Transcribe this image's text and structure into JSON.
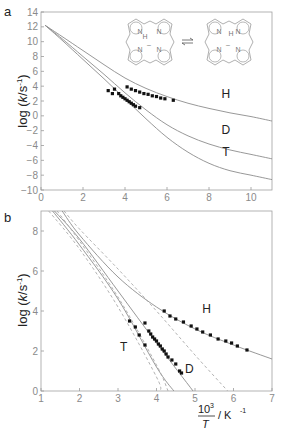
{
  "chart_data": [
    {
      "panel": "a",
      "type": "line",
      "panel_label": "a",
      "xlabel": "",
      "ylabel": "log (k/s-1)",
      "xlim": [
        0,
        11
      ],
      "ylim": [
        -10,
        14
      ],
      "xticks": [
        0,
        2,
        4,
        6,
        8,
        10
      ],
      "yticks": [
        14,
        12,
        10,
        8,
        6,
        4,
        2,
        0,
        -2,
        -4,
        -6,
        -8,
        -10
      ],
      "grid": false,
      "annotation": "porphyrin NH tautomerism (structure inset, equilibrium arrows)",
      "series": [
        {
          "name": "H",
          "style": "solid",
          "x": [
            0.2,
            1,
            2,
            3,
            4,
            5,
            6,
            7,
            8,
            9,
            10,
            11
          ],
          "y": [
            12.2,
            10.7,
            8.8,
            6.9,
            5.1,
            3.7,
            2.6,
            1.7,
            1.0,
            0.4,
            -0.1,
            -0.7
          ]
        },
        {
          "name": "D",
          "style": "solid",
          "x": [
            0.2,
            1,
            2,
            3,
            4,
            5,
            6,
            7,
            8,
            9,
            10,
            11
          ],
          "y": [
            12.2,
            10.4,
            8.0,
            5.6,
            3.1,
            0.8,
            -1.2,
            -2.7,
            -3.8,
            -4.6,
            -5.2,
            -5.8
          ]
        },
        {
          "name": "T",
          "style": "solid",
          "x": [
            0.2,
            1,
            2,
            3,
            4,
            5,
            6,
            7,
            8,
            9,
            10,
            11
          ],
          "y": [
            12.2,
            10.2,
            7.6,
            5.0,
            2.3,
            -0.4,
            -2.9,
            -4.9,
            -6.4,
            -7.4,
            -8.0,
            -8.6
          ]
        },
        {
          "name": "H data",
          "style": "points",
          "x": [
            4.1,
            4.3,
            4.5,
            4.7,
            4.9,
            5.1,
            5.3,
            5.5,
            5.7,
            5.9,
            6.3
          ],
          "y": [
            3.9,
            3.6,
            3.4,
            3.2,
            3.0,
            2.9,
            2.7,
            2.6,
            2.4,
            2.3,
            2.1
          ]
        },
        {
          "name": "D/T data",
          "style": "points",
          "x": [
            3.2,
            3.4,
            3.5,
            3.7,
            3.8,
            3.9,
            4.0,
            4.1,
            4.2,
            4.3,
            4.4,
            4.5,
            4.7
          ],
          "y": [
            3.4,
            3.0,
            3.6,
            3.0,
            2.7,
            2.5,
            2.3,
            2.1,
            1.9,
            1.7,
            1.5,
            1.3,
            1.1
          ]
        }
      ],
      "curve_labels": [
        {
          "text": "H",
          "x": 8.8,
          "y": 2.4
        },
        {
          "text": "D",
          "x": 8.8,
          "y": -2.4
        },
        {
          "text": "T",
          "x": 8.8,
          "y": -5.4
        }
      ]
    },
    {
      "panel": "b",
      "type": "line",
      "panel_label": "b",
      "xlabel": "10^3/T / K-1",
      "ylabel": "log (k/s-1)",
      "xlim": [
        1,
        7
      ],
      "ylim": [
        0,
        9
      ],
      "xticks": [
        1,
        2,
        3,
        4,
        5,
        6,
        7
      ],
      "yticks": [
        8,
        6,
        4,
        2,
        0
      ],
      "grid": false,
      "series": [
        {
          "name": "H",
          "style": "solid",
          "x": [
            1.55,
            2,
            3,
            4,
            5,
            6,
            7
          ],
          "y": [
            9.0,
            7.8,
            5.7,
            4.2,
            3.1,
            2.3,
            1.6
          ]
        },
        {
          "name": "D",
          "style": "solid",
          "x": [
            1.35,
            2,
            3,
            4,
            4.95
          ],
          "y": [
            9.0,
            7.6,
            5.0,
            2.4,
            0.0
          ]
        },
        {
          "name": "T",
          "style": "solid",
          "x": [
            1.3,
            2,
            3,
            4,
            4.45
          ],
          "y": [
            9.0,
            7.3,
            4.6,
            1.2,
            0.0
          ]
        },
        {
          "name": "D (dashed)",
          "style": "dashed",
          "x": [
            1.6,
            2,
            3,
            4,
            5,
            5.85
          ],
          "y": [
            9.0,
            8.1,
            6.1,
            4.0,
            1.8,
            0.0
          ]
        },
        {
          "name": "T dashed 1",
          "style": "dashed",
          "x": [
            1.2,
            2,
            3,
            4,
            4.1
          ],
          "y": [
            9.0,
            7.1,
            4.2,
            0.7,
            0.0
          ]
        },
        {
          "name": "T dashed 2",
          "style": "dashed",
          "x": [
            1.42,
            2,
            3,
            4,
            4.3
          ],
          "y": [
            9.0,
            7.5,
            4.7,
            1.3,
            0.0
          ]
        },
        {
          "name": "H data",
          "style": "points",
          "x": [
            4.2,
            4.35,
            4.5,
            4.7,
            4.9,
            5.05,
            5.2,
            5.4,
            5.6,
            5.8,
            5.95,
            6.1,
            6.35
          ],
          "y": [
            4.0,
            3.75,
            3.6,
            3.45,
            3.25,
            3.1,
            2.95,
            2.8,
            2.6,
            2.5,
            2.4,
            2.25,
            2.05
          ]
        },
        {
          "name": "D data",
          "style": "points",
          "x": [
            3.7,
            3.8,
            3.85,
            3.9,
            3.95,
            4.0,
            4.05,
            4.1,
            4.15,
            4.2,
            4.25,
            4.3,
            4.4,
            4.5,
            4.6,
            4.65
          ],
          "y": [
            3.4,
            3.0,
            2.85,
            2.7,
            2.6,
            2.5,
            2.35,
            2.25,
            2.1,
            2.0,
            1.85,
            1.7,
            1.55,
            1.35,
            1.0,
            0.9
          ]
        },
        {
          "name": "T data",
          "style": "points",
          "x": [
            3.3,
            3.45,
            3.55,
            3.7
          ],
          "y": [
            3.5,
            3.2,
            2.8,
            2.3
          ]
        }
      ],
      "curve_labels": [
        {
          "text": "H",
          "x": 5.3,
          "y": 3.9
        },
        {
          "text": "D",
          "x": 4.85,
          "y": 0.9
        },
        {
          "text": "T",
          "x": 3.15,
          "y": 2.0
        }
      ]
    }
  ],
  "panel_a": {
    "label": "a",
    "ylabel_main": "log (",
    "ylabel_k": "k",
    "ylabel_rest": "/s",
    "ylabel_sup": "-1",
    "ylabel_close": ")"
  },
  "panel_b": {
    "label": "b",
    "ylabel_main": "log (",
    "ylabel_k": "k",
    "ylabel_rest": "/s",
    "ylabel_sup": "-1",
    "ylabel_close": ")",
    "xlabel_num": "10",
    "xlabel_sup": "3",
    "xlabel_den": "T",
    "xlabel_unit": "/ K",
    "xlabel_unit_sup": "-1"
  },
  "molecule": {
    "atom_N": "N",
    "atom_H": "H",
    "charge": "–"
  },
  "colors": {
    "axis": "#9a9a9a",
    "curve": "#8c8c8c",
    "dashed": "#aaaaaa",
    "points": "#111111",
    "text": "#222222",
    "tick": "#8a8a8a"
  }
}
